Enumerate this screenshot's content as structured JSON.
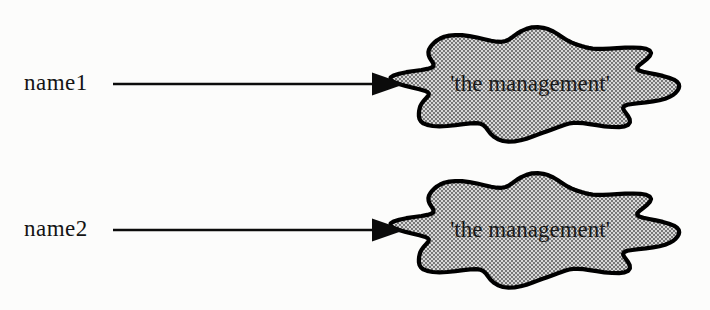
{
  "diagram": {
    "rows": [
      {
        "label": "name1",
        "target_text": "'the management'"
      },
      {
        "label": "name2",
        "target_text": "'the management'"
      }
    ],
    "colors": {
      "background": "#fcfcfb",
      "outline": "#000000",
      "arrow": "#0b0b0b",
      "blob_fill_base": "#d8d8d8",
      "blob_dot": "#4a4a4a",
      "text": "#141414"
    }
  }
}
